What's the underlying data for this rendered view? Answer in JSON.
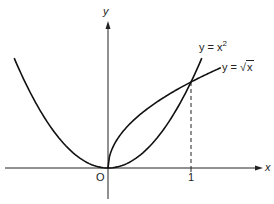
{
  "chart_data": {
    "type": "line",
    "title": "",
    "xlabel": "x",
    "ylabel": "y",
    "origin_label": "O",
    "x_ticks": [
      {
        "value": 1,
        "label": "1"
      }
    ],
    "xlim": [
      -1.25,
      1.85
    ],
    "ylim": [
      -0.3,
      1.7
    ],
    "grid": false,
    "series": [
      {
        "name": "y = x²",
        "function": "x^2",
        "domain": [
          -1.13,
          1.13
        ],
        "x": [
          -1.13,
          -1,
          -0.75,
          -0.5,
          -0.25,
          0,
          0.25,
          0.5,
          0.75,
          1,
          1.13
        ],
        "y": [
          1.28,
          1,
          0.5625,
          0.25,
          0.0625,
          0,
          0.0625,
          0.25,
          0.5625,
          1,
          1.28
        ]
      },
      {
        "name": "y = √x",
        "function": "sqrt(x)",
        "domain": [
          0,
          1.36
        ],
        "x": [
          0,
          0.05,
          0.25,
          0.5,
          0.75,
          1,
          1.36
        ],
        "y": [
          0,
          0.224,
          0.5,
          0.707,
          0.866,
          1,
          1.166
        ]
      }
    ],
    "annotations": [
      {
        "type": "dashed-vertical",
        "x": 1,
        "from_y": 0,
        "to_y": 1,
        "note": "intersection at (1,1)"
      },
      {
        "type": "label",
        "text": "y = x²",
        "near_series": 0
      },
      {
        "type": "label",
        "text": "y = √x",
        "near_series": 1
      }
    ]
  },
  "labels": {
    "y_axis": "y",
    "x_axis": "x",
    "origin": "O",
    "tick_one": "1",
    "curve_parabola": "y = x",
    "curve_parabola_exp": "2",
    "curve_sqrt_prefix": "y = ",
    "curve_sqrt_radicand": "x"
  }
}
